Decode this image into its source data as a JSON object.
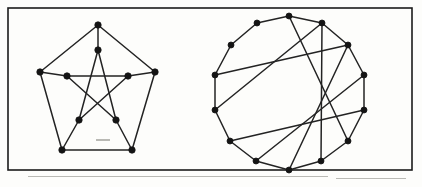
{
  "figure": {
    "background_color": "#fdfdfb",
    "ink_color": "#232323",
    "vertex_color": "#141414",
    "frame": {
      "label": "figure-border",
      "x": 8,
      "y": 8,
      "width": 404,
      "height": 162,
      "stroke": "#1b1b1b",
      "stroke_width": 1.6
    },
    "panels": [
      {
        "id": "left-panel",
        "name": "petersen-graph",
        "label": "Petersen graph",
        "vertex_count": 10,
        "edge_count": 15,
        "degree": 3,
        "vertex_radius": 3.2,
        "structure": "outer pentagon with inner pentagram joined by five spokes",
        "graph_data": {
          "type": "graph",
          "layout": "concentric-pentagon",
          "center": [
            98,
            94
          ],
          "outer_radius": 62,
          "inner_radius": 31,
          "vertices": [
            {
              "id": "o0",
              "ring": "outer",
              "x": 98,
              "y": 25
            },
            {
              "id": "o1",
              "ring": "outer",
              "x": 155,
              "y": 72
            },
            {
              "id": "o2",
              "ring": "outer",
              "x": 132,
              "y": 150
            },
            {
              "id": "o3",
              "ring": "outer",
              "x": 62,
              "y": 150
            },
            {
              "id": "o4",
              "ring": "outer",
              "x": 40,
              "y": 72
            },
            {
              "id": "i0",
              "ring": "inner",
              "x": 98,
              "y": 50
            },
            {
              "id": "i1",
              "ring": "inner",
              "x": 128,
              "y": 76
            },
            {
              "id": "i2",
              "ring": "inner",
              "x": 116,
              "y": 120
            },
            {
              "id": "i3",
              "ring": "inner",
              "x": 79,
              "y": 120
            },
            {
              "id": "i4",
              "ring": "inner",
              "x": 67,
              "y": 76
            }
          ],
          "edges": [
            [
              "o0",
              "o1"
            ],
            [
              "o1",
              "o2"
            ],
            [
              "o2",
              "o3"
            ],
            [
              "o3",
              "o4"
            ],
            [
              "o4",
              "o0"
            ],
            [
              "i0",
              "i2"
            ],
            [
              "i2",
              "i4"
            ],
            [
              "i4",
              "i1"
            ],
            [
              "i1",
              "i3"
            ],
            [
              "i3",
              "i0"
            ],
            [
              "o0",
              "i0"
            ],
            [
              "o1",
              "i1"
            ],
            [
              "o2",
              "i2"
            ],
            [
              "o3",
              "i3"
            ],
            [
              "o4",
              "i4"
            ]
          ]
        }
      },
      {
        "id": "right-panel",
        "name": "circulant-graph-14",
        "label": "14-vertex circulant graph",
        "vertex_count": 14,
        "edge_count": 21,
        "degree": 3,
        "vertex_radius": 3.0,
        "structure": "regular 14-gon cycle with chords joining vertices five steps apart",
        "graph_data": {
          "type": "graph",
          "layout": "regular-polygon",
          "center": [
            289,
            93
          ],
          "radius": 77,
          "chord_skip": 5,
          "vertices": [
            {
              "id": "v0",
              "x": 289,
              "y": 16
            },
            {
              "id": "v1",
              "x": 322,
              "y": 23
            },
            {
              "id": "v2",
              "x": 348,
              "y": 45
            },
            {
              "id": "v3",
              "x": 364,
              "y": 75
            },
            {
              "id": "v4",
              "x": 364,
              "y": 110
            },
            {
              "id": "v5",
              "x": 348,
              "y": 141
            },
            {
              "id": "v6",
              "x": 321,
              "y": 161
            },
            {
              "id": "v7",
              "x": 289,
              "y": 170
            },
            {
              "id": "v8",
              "x": 256,
              "y": 161
            },
            {
              "id": "v9",
              "x": 230,
              "y": 141
            },
            {
              "id": "v10",
              "x": 215,
              "y": 110
            },
            {
              "id": "v11",
              "x": 215,
              "y": 75
            },
            {
              "id": "v12",
              "x": 231,
              "y": 45
            },
            {
              "id": "v13",
              "x": 257,
              "y": 23
            }
          ],
          "edges": [
            [
              "v0",
              "v1"
            ],
            [
              "v1",
              "v2"
            ],
            [
              "v2",
              "v3"
            ],
            [
              "v3",
              "v4"
            ],
            [
              "v4",
              "v5"
            ],
            [
              "v5",
              "v6"
            ],
            [
              "v6",
              "v7"
            ],
            [
              "v7",
              "v8"
            ],
            [
              "v8",
              "v9"
            ],
            [
              "v9",
              "v10"
            ],
            [
              "v10",
              "v11"
            ],
            [
              "v11",
              "v12"
            ],
            [
              "v12",
              "v13"
            ],
            [
              "v13",
              "v0"
            ],
            [
              "v0",
              "v5"
            ],
            [
              "v1",
              "v6"
            ],
            [
              "v2",
              "v7"
            ],
            [
              "v3",
              "v8"
            ],
            [
              "v4",
              "v9"
            ],
            [
              "v10",
              "v1"
            ],
            [
              "v11",
              "v2"
            ]
          ]
        }
      }
    ],
    "scan_artifacts": [
      {
        "x": 96,
        "y": 139,
        "width": 14,
        "height": 2
      },
      {
        "x": 28,
        "y": 176,
        "width": 300,
        "height": 1
      },
      {
        "x": 336,
        "y": 178,
        "width": 70,
        "height": 1
      }
    ]
  }
}
